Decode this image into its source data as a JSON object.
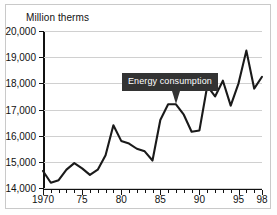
{
  "chart_data": {
    "type": "line",
    "title": "",
    "ylabel": "Million therms",
    "xlabel": "",
    "ylim": [
      14000,
      20000
    ],
    "xlim": [
      1970,
      1998
    ],
    "ytick_labels": [
      "20,000",
      "19,000",
      "18,000",
      "17,000",
      "16,000",
      "15,000",
      "14,000"
    ],
    "ytick_values": [
      20000,
      19000,
      18000,
      17000,
      16000,
      15000,
      14000
    ],
    "xtick_labels": [
      "1970",
      "75",
      "80",
      "85",
      "90",
      "95",
      "98"
    ],
    "xtick_values": [
      1970,
      1975,
      1980,
      1985,
      1990,
      1995,
      1998
    ],
    "grid": true,
    "legend": "none",
    "annotations": [
      {
        "text": "Energy consumption",
        "points_to_x": 1987,
        "points_to_y": 17250
      }
    ],
    "series": [
      {
        "name": "Energy consumption",
        "color": "#1a1a1a",
        "x": [
          1970,
          1971,
          1972,
          1973,
          1974,
          1975,
          1976,
          1977,
          1978,
          1979,
          1980,
          1981,
          1982,
          1983,
          1984,
          1985,
          1986,
          1987,
          1988,
          1989,
          1990,
          1991,
          1992,
          1993,
          1994,
          1995,
          1996,
          1997,
          1998
        ],
        "values": [
          14650,
          14200,
          14300,
          14700,
          14950,
          14750,
          14500,
          14700,
          15250,
          16400,
          15800,
          15700,
          15500,
          15400,
          15050,
          16600,
          17200,
          17200,
          16800,
          16150,
          16200,
          17900,
          17500,
          18100,
          17150,
          18000,
          19250,
          17800,
          18250
        ]
      }
    ]
  },
  "axis": {
    "y_title": "Million therms"
  }
}
